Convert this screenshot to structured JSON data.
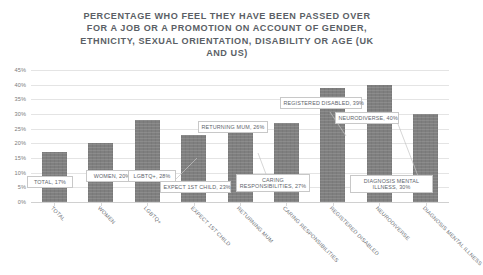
{
  "chart_data": {
    "type": "bar",
    "title": "PERCENTAGE WHO FEEL THEY HAVE BEEN PASSED OVER FOR A JOB OR A PROMOTION ON ACCOUNT OF GENDER, ETHNICITY, SEXUAL ORIENTATION, DISABILITY OR AGE (UK AND US)",
    "title_lines": [
      "PERCENTAGE WHO FEEL THEY HAVE BEEN PASSED OVER",
      "FOR A JOB OR A PROMOTION ON ACCOUNT OF GENDER,",
      "ETHNICITY, SEXUAL ORIENTATION, DISABILITY OR AGE (UK",
      "AND US)"
    ],
    "xlabel": "",
    "ylabel": "",
    "ylim": [
      0,
      45
    ],
    "ytick_step": 5,
    "grid": true,
    "legend": "none",
    "bar_color": "#7f7f7f",
    "categories": [
      "TOTAL",
      "WOMEN",
      "LGBTQ+",
      "EXPECT 1ST CHILD",
      "RETURNING MUM",
      "CARING RESPONSIBILITIES",
      "REGISTERED DISABLED",
      "NEURODIVERSE",
      "DIAGNOSIS MENTAL ILLNESS"
    ],
    "values": [
      17,
      20,
      28,
      23,
      26,
      27,
      39,
      40,
      30
    ],
    "ticks": [
      "45%",
      "40%",
      "35%",
      "30%",
      "25%",
      "20%",
      "15%",
      "10%",
      "5%",
      "0%"
    ],
    "data_labels": [
      "TOTAL, 17%",
      "WOMEN, 20%",
      "LGBTQ+, 28%",
      "EXPECT 1ST CHILD, 23%",
      "RETURNING MUM,  26%",
      "CARING RESPONSIBILITIES, 27%",
      "REGISTERED DISABLED, 39%",
      "NEURODIVERSE, 40%",
      "DIAGNOSIS MENTAL ILLNESS, 30%"
    ]
  }
}
